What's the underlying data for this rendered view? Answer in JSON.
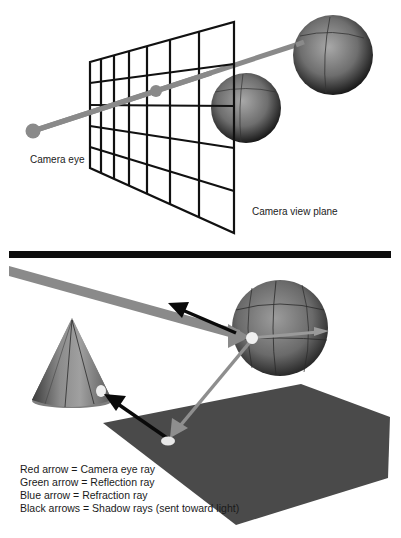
{
  "top_panel": {
    "camera_eye_label": "Camera eye",
    "view_plane_label": "Camera view plane",
    "grid": {
      "columns": 7,
      "rows": 5
    }
  },
  "bottom_panel": {
    "legend": [
      "Red arrow = Camera eye ray",
      "Green arrow = Reflection ray",
      "Blue arrow = Refraction ray",
      "Black arrows = Shadow rays (sent toward light)"
    ]
  },
  "colors": {
    "ray": "#8a8a8a",
    "grid": "#111111",
    "divider": "#0d0d0d",
    "plane": "#4a4a4a",
    "shadow_arrow": "#0a0a0a",
    "hit_glow": "#eeeeee"
  }
}
